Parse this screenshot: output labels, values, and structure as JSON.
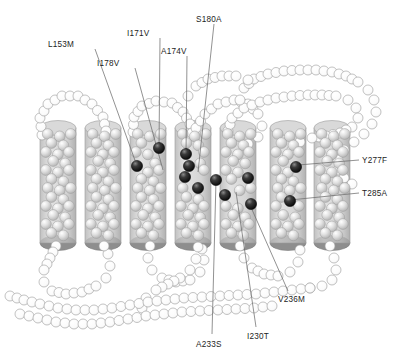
{
  "figure": {
    "background_color": "#ffffff",
    "helix_count": 7,
    "residue_sphere_color": "#d8d8d8",
    "mutation_sphere_color": "#1a1a1a",
    "loop_sphere_color": "#fdfdfd",
    "cylinder_fill": "#c9c9c9",
    "cylinder_top_fill": "#d9d9d9",
    "cylinder_bottom_fill": "#8e8e8e",
    "leader_line_color": "#6e6e6e",
    "label_color": "#1c1c1c"
  },
  "labels": [
    {
      "id": "l153m",
      "text": "L153M",
      "x": 48,
      "y": 41,
      "anchor_x": 95,
      "anchor_y": 49,
      "target_x": 137,
      "target_y": 166
    },
    {
      "id": "i178v",
      "text": "I178V",
      "x": 97,
      "y": 60,
      "anchor_x": 135,
      "anchor_y": 68,
      "target_x": 163,
      "target_y": 170
    },
    {
      "id": "i171v",
      "text": "I171V",
      "x": 127,
      "y": 30,
      "anchor_x": 160,
      "anchor_y": 38,
      "target_x": 159,
      "target_y": 148
    },
    {
      "id": "a174v",
      "text": "A174V",
      "x": 161,
      "y": 48,
      "anchor_x": 187,
      "anchor_y": 56,
      "target_x": 186,
      "target_y": 154
    },
    {
      "id": "s180a",
      "text": "S180A",
      "x": 196,
      "y": 16,
      "anchor_x": 214,
      "anchor_y": 24,
      "target_x": 198,
      "target_y": 172
    },
    {
      "id": "y277f",
      "text": "Y277F",
      "x": 362,
      "y": 157,
      "anchor_x": 359,
      "anchor_y": 160,
      "target_x": 298,
      "target_y": 165
    },
    {
      "id": "t285a",
      "text": "T285A",
      "x": 362,
      "y": 190,
      "anchor_x": 359,
      "anchor_y": 193,
      "target_x": 290,
      "target_y": 200
    },
    {
      "id": "v236m",
      "text": "V236M",
      "x": 278,
      "y": 296,
      "anchor_x": 288,
      "anchor_y": 291,
      "target_x": 250,
      "target_y": 205
    },
    {
      "id": "i230t",
      "text": "I230T",
      "x": 247,
      "y": 333,
      "anchor_x": 256,
      "anchor_y": 327,
      "target_x": 236,
      "target_y": 192
    },
    {
      "id": "a233s",
      "text": "A233S",
      "x": 196,
      "y": 341,
      "anchor_x": 212,
      "anchor_y": 334,
      "target_x": 216,
      "target_y": 180
    }
  ],
  "mutation_residues": [
    {
      "label": "I171V",
      "x": 159,
      "y": 148
    },
    {
      "label": "L153M",
      "x": 137,
      "y": 166
    },
    {
      "label": "A174V",
      "x": 186,
      "y": 154
    },
    {
      "label": "I178V",
      "x": 189,
      "y": 166
    },
    {
      "label": "S180A",
      "x": 185,
      "y": 177
    },
    {
      "label": "extra-1",
      "x": 198,
      "y": 188
    },
    {
      "label": "A233S",
      "x": 216,
      "y": 180
    },
    {
      "label": "I230T",
      "x": 225,
      "y": 195
    },
    {
      "label": "V236M",
      "x": 248,
      "y": 178
    },
    {
      "label": "V236M-b",
      "x": 251,
      "y": 204
    },
    {
      "label": "Y277F",
      "x": 296,
      "y": 167
    },
    {
      "label": "T285A",
      "x": 290,
      "y": 201
    }
  ],
  "helices": [
    {
      "index": 1,
      "cx": 58,
      "top": 128,
      "bottom": 243,
      "width": 36
    },
    {
      "index": 2,
      "cx": 103,
      "top": 128,
      "bottom": 243,
      "width": 36
    },
    {
      "index": 3,
      "cx": 148,
      "top": 128,
      "bottom": 243,
      "width": 36
    },
    {
      "index": 4,
      "cx": 193,
      "top": 128,
      "bottom": 243,
      "width": 36
    },
    {
      "index": 5,
      "cx": 238,
      "top": 128,
      "bottom": 243,
      "width": 36
    },
    {
      "index": 6,
      "cx": 288,
      "top": 128,
      "bottom": 243,
      "width": 36
    },
    {
      "index": 7,
      "cx": 332,
      "top": 128,
      "bottom": 243,
      "width": 36
    }
  ]
}
